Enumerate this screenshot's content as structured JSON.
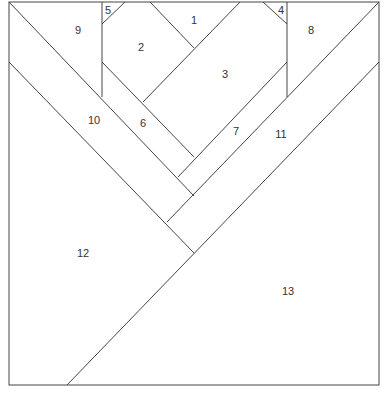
{
  "diagram": {
    "type": "paper-piecing pattern",
    "pieces": [
      {
        "id": "1",
        "x": 194,
        "y": 20
      },
      {
        "id": "2",
        "x": 141,
        "y": 47
      },
      {
        "id": "3",
        "x": 225,
        "y": 74
      },
      {
        "id": "4",
        "x": 281,
        "y": 10
      },
      {
        "id": "5",
        "x": 108,
        "y": 10
      },
      {
        "id": "6",
        "x": 143,
        "y": 123
      },
      {
        "id": "7",
        "x": 236,
        "y": 131
      },
      {
        "id": "8",
        "x": 311,
        "y": 30
      },
      {
        "id": "9",
        "x": 78,
        "y": 30
      },
      {
        "id": "10",
        "x": 94,
        "y": 120
      },
      {
        "id": "11",
        "x": 281,
        "y": 134
      },
      {
        "id": "12",
        "x": 83,
        "y": 253
      },
      {
        "id": "13",
        "x": 288,
        "y": 291
      }
    ],
    "line_color": "#444444"
  }
}
